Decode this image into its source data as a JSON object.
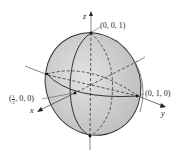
{
  "figure": {
    "type": "ellipsoid",
    "fill_color": "#d2d2d2",
    "edge_color": "#333333",
    "axes": {
      "x": {
        "label": "x"
      },
      "y": {
        "label": "y"
      },
      "z": {
        "label": "z"
      }
    },
    "points": [
      {
        "id": "z-intercept",
        "label": "(0, 0, 1)"
      },
      {
        "id": "y-intercept",
        "label": "(0, 1, 0)"
      },
      {
        "id": "x-intercept",
        "label_paren_open": "(",
        "label_num": "1",
        "label_den": "2",
        "label_rest": ", 0, 0)"
      }
    ]
  }
}
